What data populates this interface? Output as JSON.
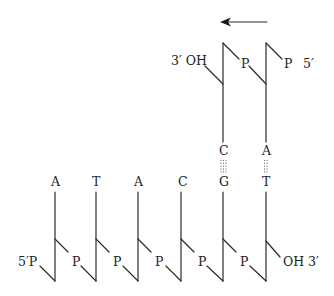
{
  "diagram": {
    "type": "dna-replication-strands",
    "arrow": {
      "direction": "left",
      "color": "#1a1a1a"
    },
    "top_strand": {
      "left_label": "3′ OH",
      "right_label": "5′",
      "phosphates": [
        "P",
        "P"
      ],
      "bases": [
        "C",
        "A"
      ]
    },
    "bottom_strand": {
      "left_label": "5′P",
      "right_label": "OH 3′",
      "phosphates": [
        "P",
        "P",
        "P",
        "P",
        "P"
      ],
      "bases": [
        "A",
        "T",
        "A",
        "C",
        "G",
        "T"
      ]
    },
    "base_pairs": [
      {
        "top": "C",
        "bottom": "G",
        "hydrogen_bonds": 3
      },
      {
        "top": "A",
        "bottom": "T",
        "hydrogen_bonds": 2
      }
    ],
    "line_color": "#2a2a2a"
  }
}
